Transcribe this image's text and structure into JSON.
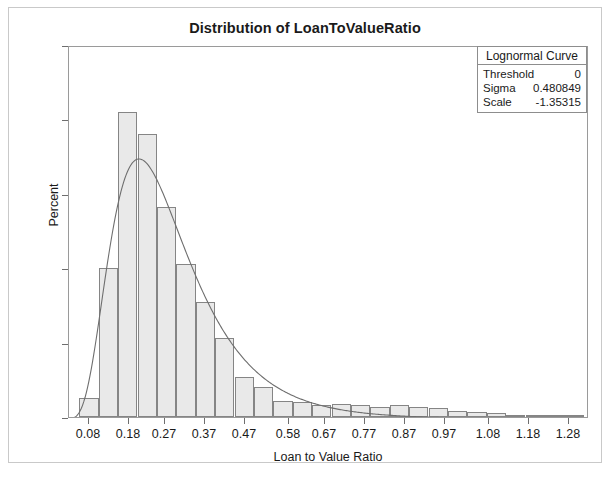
{
  "chart_data": {
    "type": "bar",
    "title": "Distribution of LoanToValueRatio",
    "xlabel": "Loan to Value Ratio",
    "ylabel": "Percent",
    "ylim": [
      0,
      25
    ],
    "xlim": [
      0.03,
      1.33
    ],
    "grid": false,
    "ytick_labels": [
      "0",
      "5",
      "10",
      "15",
      "20",
      "25"
    ],
    "ytick_values": [
      0,
      5,
      10,
      15,
      20,
      25
    ],
    "xtick_labels": [
      "0.08",
      "0.18",
      "0.27",
      "0.37",
      "0.47",
      "0.58",
      "0.67",
      "0.77",
      "0.87",
      "0.97",
      "1.08",
      "1.18",
      "1.28"
    ],
    "xtick_values": [
      0.08,
      0.18,
      0.27,
      0.37,
      0.47,
      0.58,
      0.67,
      0.77,
      0.87,
      0.97,
      1.08,
      1.18,
      1.28
    ],
    "bin_width": 0.0485,
    "bin_centers": [
      0.08,
      0.1285,
      0.177,
      0.2255,
      0.274,
      0.3225,
      0.371,
      0.4195,
      0.468,
      0.5165,
      0.565,
      0.6135,
      0.662,
      0.7105,
      0.759,
      0.8075,
      0.856,
      0.9045,
      0.953,
      1.0015,
      1.05,
      1.0985,
      1.147,
      1.1955,
      1.244,
      1.2925
    ],
    "values": [
      1.3,
      10.0,
      20.5,
      19.0,
      14.1,
      10.3,
      7.7,
      5.3,
      2.7,
      2.0,
      1.1,
      1.0,
      0.8,
      0.9,
      0.8,
      0.7,
      0.8,
      0.7,
      0.6,
      0.4,
      0.35,
      0.25,
      0.15,
      0.1,
      0.07,
      0.05
    ],
    "series": [
      {
        "name": "Lognormal Curve",
        "type": "line",
        "threshold": 0,
        "sigma": 0.480849,
        "scale": -1.35315,
        "peak_x": 0.207,
        "peak_y": 18.0
      }
    ],
    "bar_fill_color": "#e9e9e9",
    "bar_border_color": "#858585",
    "curve_color": "#6e6e6e",
    "axis_color": "#9a9a9a",
    "text_color": "#1a1a1a"
  },
  "legend": {
    "title": "Lognormal Curve",
    "rows": [
      {
        "key": "Threshold",
        "value": "0"
      },
      {
        "key": "Sigma",
        "value": "0.480849"
      },
      {
        "key": "Scale",
        "value": "-1.35315"
      }
    ]
  }
}
